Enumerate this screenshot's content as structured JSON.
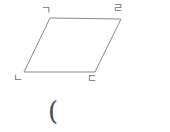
{
  "figure": {
    "type": "parallelogram",
    "stroke_color": "#8a8a8a",
    "stroke_width": 1,
    "fill_color": "#ffffff",
    "background_color": "#ffffff",
    "vertices": [
      {
        "id": "top-left",
        "label": "ㄱ",
        "x": 50,
        "y": 18
      },
      {
        "id": "top-right",
        "label": "ㄹ",
        "x": 121,
        "y": 19
      },
      {
        "id": "bottom-right",
        "label": "ㄷ",
        "x": 95,
        "y": 72
      },
      {
        "id": "bottom-left",
        "label": "ㄴ",
        "x": 24,
        "y": 72
      }
    ],
    "path": "M 50 18 L 121 19 L 95 72 L 24 72 Z"
  },
  "labels": {
    "top_left": "ㄱ",
    "top_right": "ㄹ",
    "bottom_left": "ㄴ",
    "bottom_right": "ㄷ"
  },
  "answer": {
    "paren": "("
  }
}
